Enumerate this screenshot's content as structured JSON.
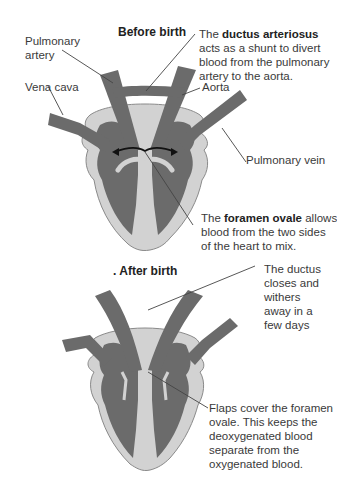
{
  "colors": {
    "vessel_dark": "#6b6b6b",
    "heart_light": "#d2d2d2",
    "outline": "#888888",
    "leader_line": "#444444",
    "text": "#3a3a3a"
  },
  "before_birth": {
    "title": "Before birth",
    "labels": {
      "pulmonary_artery_line1": "Pulmonary",
      "pulmonary_artery_line2": "artery",
      "vena_cava": "Vena cava",
      "aorta": "Aorta",
      "pulmonary_vein": "Pulmonary vein"
    },
    "ductus_note": {
      "prefix": "The ",
      "bold": "ductus arteriosus",
      "line2": "acts as a shunt to divert",
      "line3": "blood from the pulmonary",
      "line4": "artery to the aorta."
    },
    "foramen_note": {
      "prefix": "The ",
      "bold": "foramen ovale",
      "suffix": " allows",
      "line2": "blood from the two sides",
      "line3": "of the heart to mix."
    }
  },
  "after_birth": {
    "title": ". After birth",
    "ductus_note": {
      "line1": "The ductus",
      "line2": "closes and",
      "line3": "withers",
      "line4": "away in a",
      "line5": "few days"
    },
    "flaps_note": {
      "line1": "Flaps cover the foramen",
      "line2": "ovale. This keeps the",
      "line3": "deoxygenated blood",
      "line4": "separate from the",
      "line5": "oxygenated blood."
    }
  }
}
